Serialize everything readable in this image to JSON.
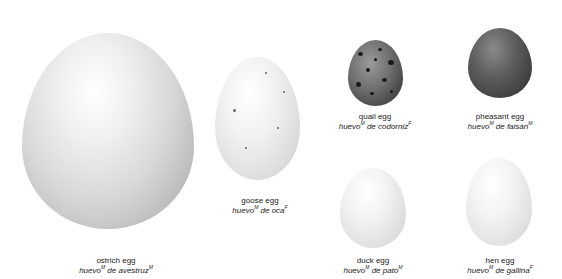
{
  "eggs": [
    {
      "id": "ostrich",
      "en": "ostrich egg",
      "es_word": "huevo",
      "es_sup1": "M",
      "es_rest": " de avestruz",
      "es_sup2": "M"
    },
    {
      "id": "goose",
      "en": "goose egg",
      "es_word": "huevo",
      "es_sup1": "M",
      "es_rest": " de oca",
      "es_sup2": "F"
    },
    {
      "id": "quail",
      "en": "quail egg",
      "es_word": "huevo",
      "es_sup1": "M",
      "es_rest": " de codorniz",
      "es_sup2": "F"
    },
    {
      "id": "pheasant",
      "en": "pheasant egg",
      "es_word": "huevo",
      "es_sup1": "M",
      "es_rest": " de faisán",
      "es_sup2": "M"
    },
    {
      "id": "duck",
      "en": "duck egg",
      "es_word": "huevo",
      "es_sup1": "M",
      "es_rest": " de pato",
      "es_sup2": "M"
    },
    {
      "id": "hen",
      "en": "hen egg",
      "es_word": "huevo",
      "es_sup1": "M",
      "es_rest": " de gallina",
      "es_sup2": "F"
    }
  ]
}
